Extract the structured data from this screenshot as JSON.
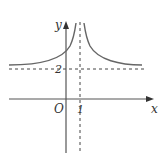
{
  "diagram": {
    "type": "function-graph",
    "axes": {
      "x_label": "x",
      "y_label": "y",
      "origin_label": "O"
    },
    "ticks": {
      "x_tick": "1",
      "y_tick": "2"
    },
    "asymptotes": {
      "vertical": "x = 1",
      "horizontal": "y = 2"
    },
    "colors": {
      "curve": "#666666",
      "axis": "#555555",
      "dash": "#444444"
    }
  }
}
